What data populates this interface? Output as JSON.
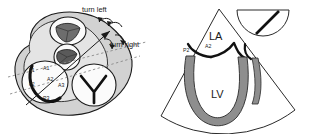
{
  "figure": {
    "type": "medical-illustration",
    "background_color": "#ffffff",
    "outline_color": "#1a1a1a"
  },
  "palette": {
    "body_fill": "#d2d2d2",
    "body_fill_light": "#e4e4e4",
    "chamber_fill": "#fbfbfb",
    "leaflet_dark": "#6d6d6d",
    "leaflet_darker": "#5a5a5a",
    "myocardium": "#8e8e8e",
    "sector_fill": "#ffffff",
    "outline": "#1a1a1a",
    "dashed_plane": "#8a8a8a"
  },
  "left_panel": {
    "name": "valve-plane-surgeons-view",
    "annotations": [
      {
        "id": "turn-left",
        "label": "turn left",
        "x": 96,
        "y": 12
      },
      {
        "id": "turn-right",
        "label": "turn right",
        "x": 120,
        "y": 43
      }
    ],
    "valves": [
      {
        "id": "aortic-valve",
        "leaflets": 3,
        "fill": "#6d6d6d",
        "cx": 68,
        "cy": 31,
        "r": 17
      },
      {
        "id": "pulmonic-valve",
        "leaflets": 3,
        "fill": "#5a5a5a",
        "cx": 67,
        "cy": 57,
        "r": 13
      },
      {
        "id": "mitral-valve",
        "leaflets": 2,
        "fill": "#fbfbfb",
        "cx": 45,
        "cy": 82,
        "r": 22
      },
      {
        "id": "tricuspid-valve",
        "leaflets": 3,
        "fill": "#fbfbfb",
        "cx": 93,
        "cy": 85,
        "r": 22
      }
    ],
    "mitral_scallops": [
      {
        "label": "A1",
        "x": 43,
        "y": 70
      },
      {
        "label": "A2",
        "x": 47,
        "y": 81
      },
      {
        "label": "A3",
        "x": 58,
        "y": 87
      },
      {
        "label": "P1",
        "x": 32,
        "y": 72
      },
      {
        "label": "P2",
        "x": 33,
        "y": 85
      },
      {
        "label": "P3",
        "x": 46,
        "y": 99
      }
    ],
    "scan_planes": [
      {
        "id": "scan-plane-upper",
        "style": "dashed"
      },
      {
        "id": "scan-plane-lower",
        "style": "dashed"
      }
    ]
  },
  "right_panel": {
    "name": "echo-sector-view",
    "chambers": [
      {
        "label": "LA",
        "name": "left-atrium",
        "x": 44,
        "y": 36
      },
      {
        "label": "LV",
        "name": "left-ventricle",
        "x": 48,
        "y": 94
      }
    ],
    "leaflet_labels": [
      {
        "label": "P2",
        "name": "posterior-leaflet-p2",
        "x": 33,
        "y": 52
      },
      {
        "label": "A2",
        "name": "anterior-leaflet-a2",
        "x": 52,
        "y": 48
      }
    ],
    "transducer_indicator": {
      "name": "transducer-orientation-icon",
      "shape": "semicircle-with-angle-marker"
    }
  }
}
